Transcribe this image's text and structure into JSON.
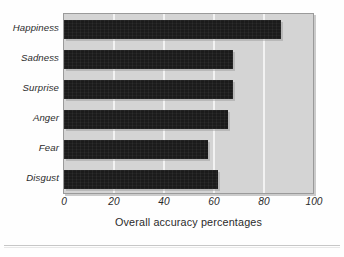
{
  "chart_data": {
    "type": "bar",
    "orientation": "horizontal",
    "title": "",
    "subtitle": "",
    "xlabel": "Overall accuracy percentages",
    "ylabel": "",
    "categories": [
      "Happiness",
      "Sadness",
      "Surprise",
      "Anger",
      "Fear",
      "Disgust"
    ],
    "values": [
      87,
      68,
      68,
      66,
      58,
      62
    ],
    "series": [
      {
        "name": "Overall accuracy percentages",
        "values": [
          87,
          68,
          68,
          66,
          58,
          62
        ]
      }
    ],
    "xlim": [
      0,
      100
    ],
    "xticks": [
      0,
      20,
      40,
      60,
      80,
      100
    ],
    "xtick_labels": [
      "0",
      "20",
      "40",
      "60",
      "80",
      "100"
    ],
    "ytick_labels": [
      "Happiness",
      "Sadness",
      "Surprise",
      "Anger",
      "Fear",
      "Disgust"
    ],
    "grid": true,
    "grid_axis": "x",
    "grid_color": "#f2f2f2",
    "legend": false,
    "legend_position": "none",
    "annotations": [],
    "colors": {
      "bar": "#1b1b1b",
      "plot_background": "#d4d4d4",
      "figure_background": "#fefefe",
      "plot_border": "#9a9a9a",
      "gridline": "#f2f2f2",
      "text": "#2a2a2a",
      "separator_rule": "#c7c7c7"
    }
  },
  "axis": {
    "x_title": "Overall accuracy percentages"
  }
}
